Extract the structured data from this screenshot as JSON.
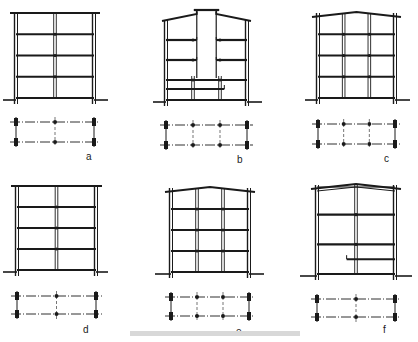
{
  "figure": {
    "panels": [
      {
        "id": "a",
        "label": "a",
        "roof": "flat",
        "floors": 4,
        "interior_columns": 1,
        "plan_columns": 3,
        "features": []
      },
      {
        "id": "b",
        "label": "b",
        "roof": "stepped-with-central-atrium",
        "floors": 4,
        "interior_columns": 2,
        "plan_columns": 4,
        "features": [
          "atrium",
          "cantilever-balconies"
        ]
      },
      {
        "id": "c",
        "label": "c",
        "roof": "gable",
        "floors": 4,
        "interior_columns": 2,
        "plan_columns": 4,
        "features": []
      },
      {
        "id": "d",
        "label": "d",
        "roof": "flat",
        "floors": 4,
        "interior_columns": 1,
        "plan_columns": 3,
        "features": []
      },
      {
        "id": "e",
        "label": "e",
        "roof": "gable",
        "floors": 4,
        "interior_columns": 2,
        "plan_columns": 4,
        "features": []
      },
      {
        "id": "f",
        "label": "f",
        "roof": "gable-truss",
        "floors": 3,
        "interior_columns": 1,
        "plan_columns": 3,
        "features": [
          "partial-mezzanine"
        ]
      }
    ],
    "colors": {
      "ink": "#1a1a1a",
      "paper": "#ffffff",
      "caption": "#d8d8d8"
    }
  }
}
